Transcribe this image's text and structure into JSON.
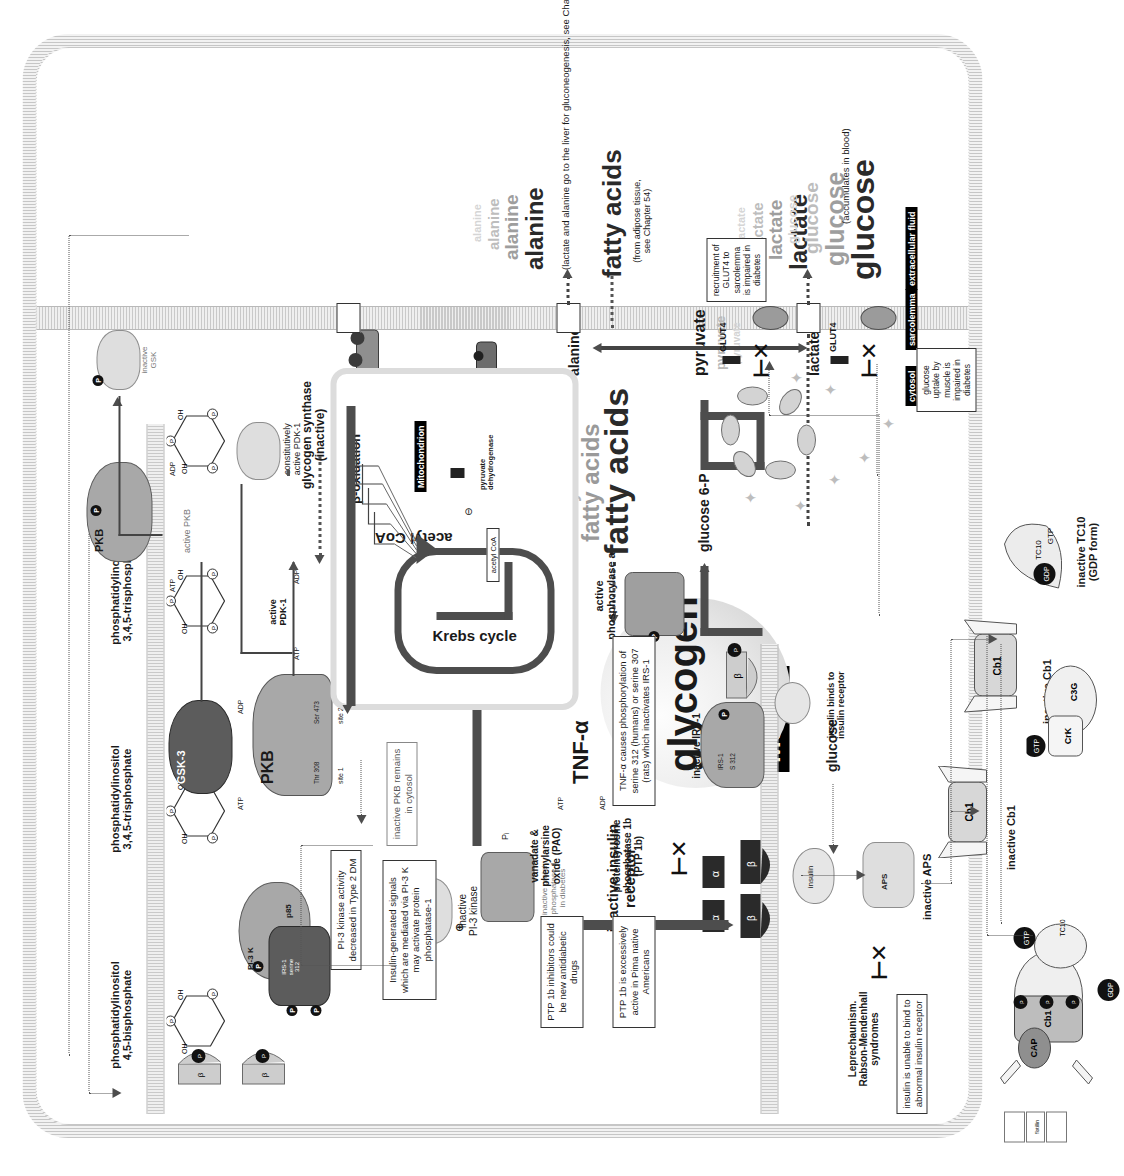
{
  "figure": {
    "compartments": {
      "cytosol": "cytosol",
      "sarcolemma": "sarcolemma",
      "extracellular_fluid": "extracellular fluid",
      "muscle": "Muscle",
      "mitochondrion": "Mitochondrion"
    }
  },
  "membrane_lipids": [
    {
      "id": "pip2",
      "label": "phosphatidylinositol\n4,5-bisphosphate"
    },
    {
      "id": "pip3a",
      "label": "phosphatidylinositol\n3,4,5-trisphosphate"
    },
    {
      "id": "pip3b",
      "label": "phosphatidylinositol\n3,4,5-trisphosphate"
    }
  ],
  "receptor_section": {
    "syndromes_label": "Leprechaunism.\nRabson-Mendenhall\nsyndromes",
    "insulin_bind_note": "insulin is unable to\nbind to abnormal\ninsulin receptor",
    "insulin_binds_label": "insulin binds to\ninsulin receptor",
    "insulin_label": "insulin",
    "inactive_receptor_label": "inactive insulin\nreceptor",
    "subunit_alpha": "α",
    "subunit_beta": "β",
    "ptp1b_label": "proteintyrosine\nphosphatase 1b\n(PTP 1b)",
    "inhibitors_label": "vanadate &\nphenylarsine\noxide (PAO)",
    "ptp1b_note_a": "PTP 1b inhibitors\ncould be new\nantidiabetic drugs",
    "ptp1b_note_b": "PTP 1b is\nexcessively active in\nPima native Americans",
    "pi_label": "Pᵢ"
  },
  "irs_section": {
    "tnf_label": "TNF-α",
    "tnf_note": "TNF-α causes phosphorylation of\nserine 312 (humans) or serine\n307 (rats) which inactivates IRS-1",
    "inactive_irs1_label": "inactive IRS-1",
    "irs1_chip": "IRS-1",
    "ser312_chip": "S 312",
    "atp": "ATP",
    "adp": "ADP",
    "irs1_site_label": "IRS-1\nserine\n312"
  },
  "pi3k_section": {
    "pi3k_chip": "PI-3 K",
    "p85_chip": "p85",
    "note": "PI-3 kinase\nactivity\ndecreased in\nType 2 DM",
    "inactive_label": "inactive\nPI-3 kinase"
  },
  "pdk_pkb_section": {
    "constitutively_active_pdk1": "constitutively\nactive PDK-1",
    "active_pdk1": "active\nPDK-1",
    "pkb_label": "PKB",
    "active_pkb": "active PKB",
    "inactive_pkb_note": "inactive PKB\nremains in cytosol",
    "gsk3_label": "GSK-3",
    "inactive_gsk_label": "inactive\nGSK",
    "site1": "site 1",
    "site2": "site 2",
    "thr308": "Thr 308",
    "ser473": "Ser 473",
    "atp": "ATP",
    "adp": "ADP"
  },
  "glycogen_section": {
    "constitutively_active_gsk3": "constitutively\nactive GSK-3",
    "glycogen_synthase_inactive": "glycogen synthase\n(inactive)",
    "glycogen_synthase_active": "glycogen synthase\n(active)",
    "glycogen_label": "glycogen",
    "oligosaccharide_polymer": "oligosaccharide\npolymer",
    "udp_glucose": "UDP glucose",
    "utp": "UTP",
    "active_phosphorylase_a": "active\nphosphorylase a",
    "glucose_6p": "glucose 6-P",
    "glucose": "glucose",
    "pi_label": "Pᵢ"
  },
  "phosphatase_section": {
    "note": "Insulin-generated signals\nwhich are mediated via\nPI-3 K may activate\nprotein phosphatase-1",
    "inactive_pp1_label": "inactive protein\nphosphatase-1\nin diabetes",
    "plus_sign": "⊕"
  },
  "metabolites": {
    "fatty_acids": "fatty acids",
    "fatty_acids_outside": "fatty acids",
    "fatty_acids_source": "(from adipose tissue,\nsee Chapter 54)",
    "alanine": "alanine",
    "alanine_outside": "alanine",
    "lactate": "lactate",
    "lactate_outside": "lactate",
    "pyruvate": "pyruvate",
    "glucose_outside": "glucose",
    "glucose_note": "(accumulates in blood)",
    "liver_note": "(lactate and alanine go to the liver for gluconeogenesis, see Chapter 55)",
    "acetyl_coa": "acetyl CoA",
    "acetyl_coa_chip": "acetyl CoA",
    "pyruvate_dehydrogenase": "pyruvate\ndehydrogenase",
    "beta_oxidation": "β-oxidation",
    "krebs_cycle": "Krebs cycle",
    "minus_sign": "⊖"
  },
  "glut4_section": {
    "glut4_vesicle_label": "GLUT4",
    "glut4_membrane_label": "GLUT4",
    "recruitment_note": "recruitment\nof GLUT4 to\nsarcolemma\nis impaired\nin diabetes",
    "uptake_note": "glucose\nuptake by\nmuscle is\nimpaired in\ndiabetes"
  },
  "cbl_section": {
    "inactive_aps_label": "inactive APS",
    "inactive_cbl_label": "inactive Cb1",
    "inactive_cbl_label2": "inactive Cb1",
    "inactive_tc10_label": "inactive TC10\n(GDP form)",
    "aps_chip": "APS",
    "cbl_chip": "Cb1",
    "crk_chip": "Crk",
    "c3g_chip": "C3G",
    "gtp_chip": "GTP",
    "gdp_chip": "GDP",
    "tc10_chip": "TC10",
    "cap_chip": "CAP",
    "flotillin_chip": "flotillin"
  },
  "colors": {
    "ink": "#1a1a1a",
    "membrane": "#cfcfcf",
    "arrow": "#4d4d4d",
    "ghost": "#c7c7c7",
    "protein": "#a8a8a8",
    "protein_dark": "#5c5c5c",
    "highlight": "#000000"
  }
}
